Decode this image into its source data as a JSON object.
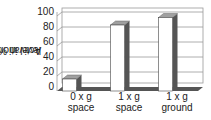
{
  "chart_data": {
    "type": "bar",
    "title": "",
    "xlabel": "",
    "ylabel": "Activation level in %",
    "ylabel_lines": [
      "Activation",
      "level in %"
    ],
    "categories": [
      "0 x g space",
      "1 x g space",
      "1 x g ground"
    ],
    "category_lines": [
      [
        "0 x g",
        "space"
      ],
      [
        "1 x g",
        "space"
      ],
      [
        "1 x g",
        "ground"
      ]
    ],
    "values": [
      16,
      88,
      98
    ],
    "ylim": [
      0,
      100
    ],
    "yticks": [
      "0",
      "20",
      "40",
      "60",
      "80",
      "100"
    ],
    "grid": true,
    "style": "3d-bar",
    "colors": {
      "bar_front": "#ffffff",
      "bar_top": "#a0a0a0",
      "bar_side": "#555555",
      "floor": "#555555",
      "grid": "#999999"
    }
  }
}
